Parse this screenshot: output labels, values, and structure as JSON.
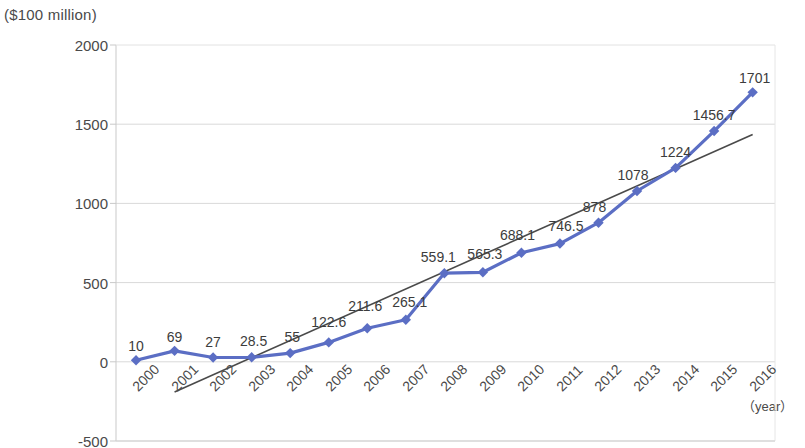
{
  "chart_data": {
    "type": "line",
    "title": "",
    "ylabel": "($100 million)",
    "xlabel": "（year）",
    "categories": [
      "2000",
      "2001",
      "2002",
      "2003",
      "2004",
      "2005",
      "2006",
      "2007",
      "2008",
      "2009",
      "2010",
      "2011",
      "2012",
      "2013",
      "2014",
      "2015",
      "2016"
    ],
    "values": [
      10,
      69,
      27,
      28.5,
      55,
      122.6,
      211.6,
      265.1,
      559.1,
      565.3,
      688.1,
      746.5,
      878,
      1078,
      1224,
      1456.7,
      1701
    ],
    "data_labels": [
      "10",
      "69",
      "27",
      "28.5",
      "55",
      "122.6",
      "211.6",
      "265.1",
      "559.1",
      "565.3",
      "688.1",
      "746.5",
      "878",
      "1078",
      "1224",
      "1456.7",
      "1701"
    ],
    "yticks": [
      "2000",
      "1500",
      "1000",
      "500",
      "0",
      "-500"
    ],
    "ytick_values": [
      2000,
      1500,
      1000,
      500,
      0,
      -500
    ],
    "ylim": [
      -500,
      2000
    ],
    "grid": true,
    "legend": "none",
    "series": [
      {
        "name": "value",
        "type": "line",
        "color": "#5b6ec4",
        "marker": "diamond",
        "values": [
          10,
          69,
          27,
          28.5,
          55,
          122.6,
          211.6,
          265.1,
          559.1,
          565.3,
          688.1,
          746.5,
          878,
          1078,
          1224,
          1456.7,
          1701
        ]
      },
      {
        "name": "trendline",
        "type": "line",
        "color": "#4a4a4a",
        "marker": "none",
        "x_start": "2001",
        "x_end": "2016",
        "y_start": -190,
        "y_end": 1435
      }
    ],
    "colors": {
      "series": "#5b6ec4",
      "trend": "#4a4a4a",
      "grid": "#d9d9d9",
      "axis": "#c9c9c9",
      "text": "#3c3c3c"
    }
  }
}
